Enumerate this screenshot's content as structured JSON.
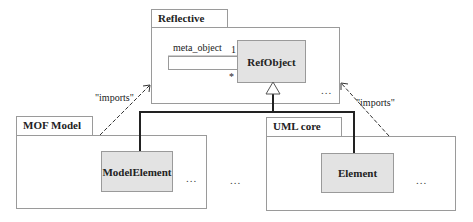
{
  "diagram": {
    "packages": [
      {
        "id": "reflective",
        "name": "Reflective",
        "ellipsis": "..."
      },
      {
        "id": "mof_model",
        "name": "MOF Model",
        "ellipsis": "..."
      },
      {
        "id": "uml_core",
        "name": "UML core",
        "ellipsis": "..."
      }
    ],
    "classes": [
      {
        "id": "refobject",
        "name": "RefObject",
        "package": "Reflective"
      },
      {
        "id": "modelelement",
        "name": "ModelElement",
        "package": "MOF Model"
      },
      {
        "id": "element",
        "name": "Element",
        "package": "UML core"
      }
    ],
    "association": {
      "role": "meta_object",
      "multiplicity_top": "1",
      "multiplicity_bottom": "*"
    },
    "dependencies": [
      {
        "from": "MOF Model",
        "to": "Reflective",
        "label": "\"imports\""
      },
      {
        "from": "UML core",
        "to": "Reflective",
        "label": "\"imports\""
      }
    ],
    "generalization": {
      "parent": "RefObject",
      "children": [
        "ModelElement",
        "Element"
      ]
    },
    "free_ellipsis": "..."
  }
}
